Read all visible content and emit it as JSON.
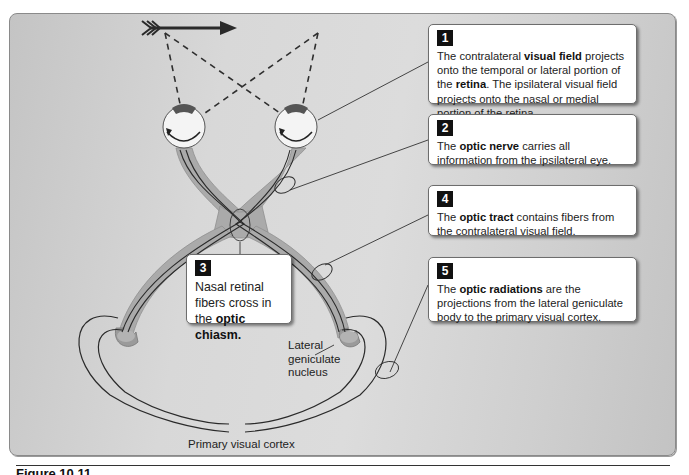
{
  "figure": {
    "caption": "Figure 10.11",
    "colors": {
      "background": "#d6d6d6",
      "nerve_fill": "#a9a9a9",
      "fiber_line": "#2a2a2a",
      "callout_bg": "#ffffff",
      "number_badge": "#111111"
    }
  },
  "callouts": [
    {
      "number": "1",
      "parts": [
        {
          "text": "The contralateral ",
          "bold": false
        },
        {
          "text": "visual field",
          "bold": true
        },
        {
          "text": " projects onto the temporal or lateral portion of the ",
          "bold": false
        },
        {
          "text": "retina",
          "bold": true
        },
        {
          "text": ". The ipsilateral visual field projects onto the nasal or medial portion of the retina.",
          "bold": false
        }
      ]
    },
    {
      "number": "2",
      "parts": [
        {
          "text": "The ",
          "bold": false
        },
        {
          "text": "optic nerve",
          "bold": true
        },
        {
          "text": " carries all information from the ipsilateral eye.",
          "bold": false
        }
      ]
    },
    {
      "number": "3",
      "parts": [
        {
          "text": "Nasal retinal fibers cross in the ",
          "bold": false
        },
        {
          "text": "optic chiasm.",
          "bold": true
        }
      ]
    },
    {
      "number": "4",
      "parts": [
        {
          "text": "The ",
          "bold": false
        },
        {
          "text": "optic tract",
          "bold": true
        },
        {
          "text": " contains fibers from the contralateral visual field.",
          "bold": false
        }
      ]
    },
    {
      "number": "5",
      "parts": [
        {
          "text": "The ",
          "bold": false
        },
        {
          "text": "optic radiations",
          "bold": true
        },
        {
          "text": " are the projections from the lateral geniculate body to the primary visual cortex.",
          "bold": false
        }
      ]
    }
  ],
  "labels": {
    "lgn": "Lateral geniculate nucleus",
    "cortex": "Primary visual cortex"
  }
}
